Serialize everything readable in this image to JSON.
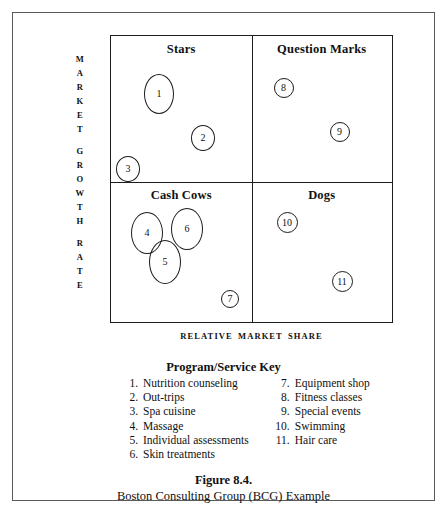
{
  "figure": {
    "caption_title": "Figure 8.4.",
    "caption_subtitle": "Boston Consulting Group (BCG) Example"
  },
  "axes": {
    "y_label": "MARKET GROWTH RATE",
    "y_label_groups": [
      "MARKET",
      "GROWTH",
      "RATE"
    ],
    "x_label": "RELATIVE  MARKET  SHARE"
  },
  "matrix": {
    "quadrants": [
      {
        "id": "stars",
        "label": "Stars"
      },
      {
        "id": "question-marks",
        "label": "Question Marks"
      },
      {
        "id": "cash-cows",
        "label": "Cash Cows"
      },
      {
        "id": "dogs",
        "label": "Dogs"
      }
    ]
  },
  "bubbles": [
    {
      "label": "1",
      "quadrant": "stars",
      "x": 33,
      "y": 38,
      "w": 30,
      "h": 40
    },
    {
      "label": "2",
      "quadrant": "stars",
      "x": 80,
      "y": 89,
      "w": 24,
      "h": 26
    },
    {
      "label": "3",
      "quadrant": "stars",
      "x": 5,
      "y": 120,
      "w": 24,
      "h": 26
    },
    {
      "label": "8",
      "quadrant": "question-marks",
      "x": 22,
      "y": 42,
      "w": 20,
      "h": 20
    },
    {
      "label": "9",
      "quadrant": "question-marks",
      "x": 78,
      "y": 86,
      "w": 20,
      "h": 20
    },
    {
      "label": "4",
      "quadrant": "cash-cows",
      "x": 20,
      "y": 30,
      "w": 32,
      "h": 42
    },
    {
      "label": "6",
      "quadrant": "cash-cows",
      "x": 60,
      "y": 26,
      "w": 32,
      "h": 42
    },
    {
      "label": "5",
      "quadrant": "cash-cows",
      "x": 38,
      "y": 58,
      "w": 32,
      "h": 44
    },
    {
      "label": "7",
      "quadrant": "cash-cows",
      "x": 110,
      "y": 108,
      "w": 18,
      "h": 18
    },
    {
      "label": "10",
      "quadrant": "dogs",
      "x": 25,
      "y": 30,
      "w": 21,
      "h": 21
    },
    {
      "label": "11",
      "quadrant": "dogs",
      "x": 80,
      "y": 89,
      "w": 21,
      "h": 21
    }
  ],
  "key": {
    "title": "Program/Service Key",
    "left_column": [
      {
        "num": "1.",
        "text": "Nutrition counseling"
      },
      {
        "num": "2.",
        "text": "Out-trips"
      },
      {
        "num": "3.",
        "text": "Spa cuisine"
      },
      {
        "num": "4.",
        "text": "Massage"
      },
      {
        "num": "5.",
        "text": "Individual assessments"
      },
      {
        "num": "6.",
        "text": "Skin treatments"
      }
    ],
    "right_column": [
      {
        "num": "7.",
        "text": "Equipment shop"
      },
      {
        "num": "8.",
        "text": "Fitness classes"
      },
      {
        "num": "9.",
        "text": "Special events"
      },
      {
        "num": "10.",
        "text": "Swimming"
      },
      {
        "num": "11.",
        "text": "Hair care"
      }
    ]
  },
  "colors": {
    "ink": "#111111",
    "frame": "#5a5a5a",
    "matrix_line": "#1c1c1c",
    "background": "#ffffff"
  }
}
